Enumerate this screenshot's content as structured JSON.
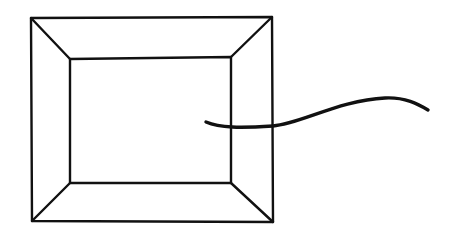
{
  "diagram": {
    "background": "#ffffff",
    "stroke_color": "#111111",
    "outer_rect": {
      "x1": 31,
      "y1": 17,
      "x2": 273,
      "y2": 222
    },
    "inner_rect": {
      "x1": 70,
      "y1": 58,
      "x2": 231,
      "y2": 183
    },
    "wire_path": "M 206 122 C 220 128, 240 128, 273 126 C 300 124, 340 100, 385 98 C 405 97, 418 104, 428 110"
  }
}
